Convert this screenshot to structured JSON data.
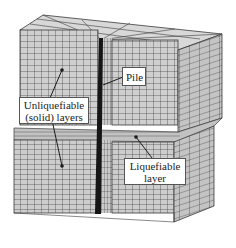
{
  "figure": {
    "type": "3D finite element mesh of soil block with pile",
    "colors": {
      "mesh_fill_front": "#cfcfcf",
      "mesh_fill_side": "#c4c4c4",
      "mesh_fill_top": "#d8d8d8",
      "grid_line": "#3a3a3a",
      "pile": "#151515",
      "label_bg": "#ffffff",
      "label_border": "#555555"
    }
  },
  "labels": {
    "pile": "Pile",
    "unliquefiable_line1": "Unliquefiable",
    "unliquefiable_line2": "(solid) layers",
    "liquefiable_line1": "Liquefiable",
    "liquefiable_line2": "layer"
  }
}
